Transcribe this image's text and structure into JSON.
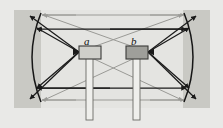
{
  "figure": {
    "type": "optics-ray-diagram",
    "title": "",
    "background_outer": "#e9e9e7",
    "background_panel": "#c9c9c4",
    "background_inner": "#e4e4e1",
    "ray_color_primary": "#1a1a1a",
    "ray_color_secondary": "#9a9a96",
    "mirror_color": "#161616"
  },
  "labels": {
    "a": "a",
    "b": "b"
  },
  "objects": [
    {
      "id": "a",
      "label": "a",
      "kind": "block-on-stem",
      "fill": "#cfcfca",
      "stroke": "#3a3a38",
      "x": 79,
      "y": 46,
      "width": 22,
      "height": 13,
      "stem_x": 90,
      "stem_bottom": 120,
      "converge_side": "left"
    },
    {
      "id": "b",
      "label": "b",
      "kind": "block-on-stem",
      "fill": "#9f9f9a",
      "stroke": "#3a3a38",
      "x": 126,
      "y": 46,
      "width": 22,
      "height": 13,
      "stem_x": 137,
      "stem_bottom": 120,
      "converge_side": "right"
    }
  ],
  "mirrors": [
    {
      "id": "left-mirror",
      "shape": "concave-arc",
      "top_x": 41,
      "top_y": 14,
      "bottom_x": 41,
      "bottom_y": 101,
      "bulge_x": 25,
      "opens": "right"
    },
    {
      "id": "right-mirror",
      "shape": "concave-arc",
      "top_x": 185,
      "top_y": 14,
      "bottom_x": 185,
      "bottom_y": 101,
      "bulge_x": 201,
      "opens": "left"
    }
  ],
  "rays": {
    "dark_label": "primary rays",
    "light_label": "secondary rays",
    "count_dark": 6,
    "count_light": 6,
    "arrowheads": "filled-triangle"
  },
  "panel": {
    "x": 14,
    "y": 10,
    "width": 196,
    "height": 98
  },
  "inner_panel": {
    "x": 41,
    "y": 10,
    "width": 142,
    "height": 98
  }
}
